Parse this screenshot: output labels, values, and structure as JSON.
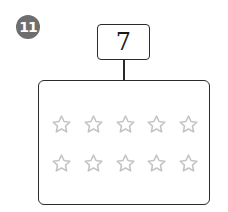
{
  "problem": {
    "number_label": "11",
    "target_value": "7"
  },
  "colors": {
    "badge": "#6e6e6e",
    "outline": "#2a2a2a",
    "star_outline": "#c4c4c4"
  },
  "stars": {
    "icon": "star-outline-icon",
    "rows": 2,
    "columns": 5,
    "total": 10,
    "filled": 0
  }
}
